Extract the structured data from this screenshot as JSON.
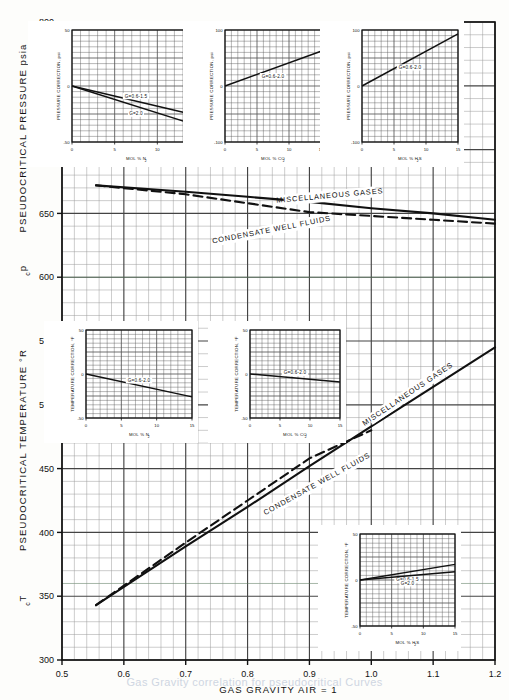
{
  "figure": {
    "x_axis_label": "GAS GRAVITY   AIR = 1",
    "y_axis_label_top": "PSEUDOCRITICAL PRESSURE   psia",
    "y_axis_symbol_top": "p",
    "y_axis_symbol_top_sub": "c",
    "y_axis_label_bottom": "PSEUDOCRITICAL TEMPERATURE  °R",
    "y_axis_symbol_bottom": "T",
    "y_axis_symbol_bottom_sub": "c",
    "bottom_caption": "Gas Gravity correlation for pseudocritical Curves"
  },
  "chart_data": {
    "type": "line",
    "xlabel": "GAS GRAVITY   AIR = 1",
    "ylabel": "PSEUDOCRITICAL PRESSURE  psia / PSEUDOCRITICAL TEMPERATURE  °R",
    "xlim": [
      0.5,
      1.2
    ],
    "xticks": [
      0.5,
      0.6,
      0.7,
      0.8,
      0.9,
      1.0,
      1.1,
      1.2
    ],
    "xticklabels": [
      "0.5",
      "0.6",
      "0.7",
      "0.8",
      "0.9",
      "1.0",
      "1.1",
      "1.2"
    ],
    "ylim": [
      300,
      800
    ],
    "yticks": [
      300,
      350,
      400,
      450,
      500,
      550,
      600,
      650,
      700,
      750,
      800
    ],
    "yticklabels": [
      "300",
      "350",
      "400",
      "450",
      "500",
      "550",
      "600",
      "650",
      "700",
      "750",
      "800"
    ],
    "grid": true,
    "minor_grid": true,
    "legend": "inline-labels",
    "series": [
      {
        "name": "MISCELLANEOUS GASES",
        "quantity": "pseudocritical pressure",
        "units": "psia",
        "style": "solid",
        "x": [
          0.555,
          0.7,
          0.8,
          0.9,
          1.0,
          1.1,
          1.2
        ],
        "y": [
          672,
          667,
          663,
          659,
          654,
          650,
          645
        ]
      },
      {
        "name": "CONDENSATE WELL FLUIDS",
        "quantity": "pseudocritical pressure",
        "units": "psia",
        "style": "dashed",
        "x": [
          0.555,
          0.7,
          0.8,
          0.9,
          1.0,
          1.1,
          1.2
        ],
        "y": [
          672,
          665,
          658,
          651,
          648,
          645,
          642
        ]
      },
      {
        "name": "MISCELLANEOUS GASES",
        "quantity": "pseudocritical temperature",
        "units": "°R",
        "style": "solid",
        "x": [
          0.555,
          0.7,
          0.8,
          0.9,
          1.0,
          1.1,
          1.2
        ],
        "y": [
          343,
          389,
          420,
          452,
          483,
          514,
          545
        ]
      },
      {
        "name": "CONDENSATE WELL FLUIDS",
        "quantity": "pseudocritical temperature",
        "units": "°R",
        "style": "dashed",
        "x": [
          0.555,
          0.7,
          0.8,
          0.9,
          1.0
        ],
        "y": [
          343,
          392,
          425,
          458,
          480
        ]
      }
    ]
  },
  "curve_labels": {
    "pressure_misc": "MISCELLANEOUS GASES",
    "pressure_cond": "CONDENSATE WELL FLUIDS",
    "temp_misc": "MISCELLANEOUS GASES",
    "temp_cond": "CONDENSATE WELL FLUIDS"
  },
  "insets": [
    {
      "id": "pressure-n2",
      "y_label": "PRESSURE CORRECTION, psi",
      "x_label": "MOL % N",
      "x_label_sub": "2",
      "ylim": [
        -50,
        50
      ],
      "yticklabels": [
        "50",
        "0",
        "-50"
      ],
      "xlim": [
        0,
        15
      ],
      "xticks": [
        0,
        5,
        10,
        15
      ],
      "xticklabels": [
        "0",
        "5",
        "10",
        "15"
      ],
      "lines": [
        {
          "label": "G=0.6-1.5",
          "x": [
            0,
            15
          ],
          "y": [
            0,
            -27
          ]
        },
        {
          "label": "G=2.0",
          "x": [
            0,
            15
          ],
          "y": [
            0,
            -36
          ]
        }
      ]
    },
    {
      "id": "pressure-co2",
      "y_label": "PRESSURE CORRECTION, psi",
      "x_label": "MOL % CO",
      "x_label_sub": "2",
      "ylim": [
        -100,
        100
      ],
      "yticklabels": [
        "100",
        "0",
        "-100"
      ],
      "xlim": [
        0,
        15
      ],
      "xticks": [
        0,
        5,
        10,
        15
      ],
      "xticklabels": [
        "0",
        "5",
        "10",
        "15"
      ],
      "lines": [
        {
          "label": "G=0.6-2.0",
          "x": [
            0,
            15
          ],
          "y": [
            0,
            62
          ]
        }
      ]
    },
    {
      "id": "pressure-h2s",
      "y_label": "PRESSURE CORRECTION, psi",
      "x_label": "MOL % H",
      "x_label_sub": "2",
      "x_label_tail": "S",
      "ylim": [
        -100,
        100
      ],
      "yticklabels": [
        "100",
        "0",
        "-100"
      ],
      "xlim": [
        0,
        15
      ],
      "xticks": [
        0,
        5,
        10,
        15
      ],
      "xticklabels": [
        "0",
        "5",
        "10",
        "15"
      ],
      "lines": [
        {
          "label": "G=0.6-2.0",
          "x": [
            0,
            15
          ],
          "y": [
            0,
            93
          ]
        }
      ]
    },
    {
      "id": "temperature-n2",
      "y_label": "TEMPERATURE CORRECTION, °F",
      "x_label": "MOL % N",
      "x_label_sub": "2",
      "ylim": [
        -50,
        50
      ],
      "yticklabels": [
        "50",
        "0",
        "-50"
      ],
      "xlim": [
        0,
        15
      ],
      "xticks": [
        0,
        5,
        10,
        15
      ],
      "xticklabels": [
        "0",
        "5",
        "10",
        "15"
      ],
      "lines": [
        {
          "label": "G=0.6-2.0",
          "x": [
            0,
            15
          ],
          "y": [
            0,
            -26
          ]
        }
      ]
    },
    {
      "id": "temperature-co2",
      "y_label": "TEMPERATURE CORRECTION, °F",
      "x_label": "MOL % CO",
      "x_label_sub": "2",
      "ylim": [
        -50,
        50
      ],
      "yticklabels": [
        "50",
        "0",
        "-50"
      ],
      "xlim": [
        0,
        15
      ],
      "xticks": [
        0,
        5,
        10,
        15
      ],
      "xticklabels": [
        "0",
        "5",
        "10",
        "15"
      ],
      "lines": [
        {
          "label": "G=0.6-2.0",
          "x": [
            0,
            15
          ],
          "y": [
            0,
            -9
          ]
        }
      ]
    },
    {
      "id": "temperature-h2s",
      "y_label": "TEMPERATURE CORRECTION, °F",
      "x_label": "MOL % H",
      "x_label_sub": "2",
      "x_label_tail": "S",
      "ylim": [
        -50,
        50
      ],
      "yticklabels": [
        "50",
        "0",
        "-50"
      ],
      "xlim": [
        0,
        15
      ],
      "xticks": [
        0,
        5,
        10,
        15
      ],
      "xticklabels": [
        "0",
        "5",
        "10",
        "15"
      ],
      "lines": [
        {
          "label": "G=0.6-1.5",
          "x": [
            0,
            15
          ],
          "y": [
            0,
            17
          ]
        },
        {
          "label": "G=2.0",
          "x": [
            0,
            15
          ],
          "y": [
            0,
            9
          ]
        }
      ]
    }
  ],
  "colors": {
    "ink": "#111111",
    "grid_major": "#444444",
    "grid_minor": "#9a9a9a",
    "paper": "#fdfdfb"
  }
}
